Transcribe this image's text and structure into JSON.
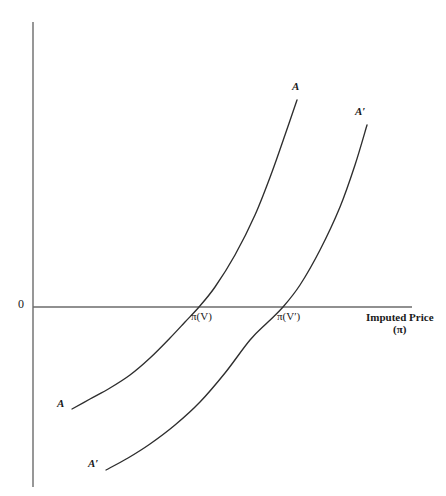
{
  "figure": {
    "background_color": "#ffffff",
    "line_color": "#333333",
    "axis_color": "#555555"
  },
  "axes": {
    "origin_label": "0",
    "x_axis_title_line1": "Imputed Price",
    "x_axis_title_line2": "(π)",
    "x_axis": {
      "x1": 33,
      "y1": 307,
      "x2": 412,
      "y2": 307
    },
    "y_axis": {
      "x1": 33,
      "y1": 22,
      "x2": 33,
      "y2": 487
    }
  },
  "labels": {
    "curve_a_top": "A",
    "curve_a_bottom": "A",
    "curve_aprime_top": "A′",
    "curve_aprime_bottom": "A′",
    "intersection_1": "π(V)",
    "intersection_2": "π(V′)"
  },
  "chart_data": {
    "type": "line",
    "title": "",
    "xlabel": "Imputed Price (π)",
    "ylabel": "",
    "grid": false,
    "legend": "inline-curve-labels",
    "xlim": [
      0,
      446
    ],
    "ylim": [
      496,
      0
    ],
    "axis_note": "Coordinates are given in screenshot pixel space; y increases downward.",
    "zero_line_y": 307,
    "annotations": [
      {
        "text": "A",
        "x": 296,
        "y": 89,
        "role": "curve-endpoint-label-top"
      },
      {
        "text": "A",
        "x": 62,
        "y": 405,
        "role": "curve-endpoint-label-bottom"
      },
      {
        "text": "A′",
        "x": 360,
        "y": 114,
        "role": "curve-endpoint-label-top"
      },
      {
        "text": "A′",
        "x": 93,
        "y": 465,
        "role": "curve-endpoint-label-bottom"
      },
      {
        "text": "π(V)",
        "x": 200,
        "y": 320,
        "role": "x-intercept-label"
      },
      {
        "text": "π(V′)",
        "x": 286,
        "y": 320,
        "role": "x-intercept-label"
      },
      {
        "text": "0",
        "x": 20,
        "y": 300,
        "role": "origin-label"
      }
    ],
    "series": [
      {
        "name": "A",
        "x_intercept_px": 199,
        "points": [
          [
            72,
            409
          ],
          [
            90,
            399
          ],
          [
            110,
            388
          ],
          [
            130,
            375
          ],
          [
            150,
            358
          ],
          [
            170,
            338
          ],
          [
            185,
            322
          ],
          [
            199,
            307
          ],
          [
            215,
            287
          ],
          [
            235,
            255
          ],
          [
            255,
            215
          ],
          [
            272,
            172
          ],
          [
            285,
            135
          ],
          [
            297,
            100
          ]
        ]
      },
      {
        "name": "A′",
        "x_intercept_px": 283,
        "points": [
          [
            106,
            470
          ],
          [
            128,
            458
          ],
          [
            150,
            444
          ],
          [
            175,
            425
          ],
          [
            200,
            402
          ],
          [
            225,
            373
          ],
          [
            250,
            340
          ],
          [
            268,
            322
          ],
          [
            283,
            307
          ],
          [
            300,
            285
          ],
          [
            320,
            250
          ],
          [
            340,
            207
          ],
          [
            355,
            165
          ],
          [
            367,
            125
          ]
        ]
      }
    ]
  }
}
